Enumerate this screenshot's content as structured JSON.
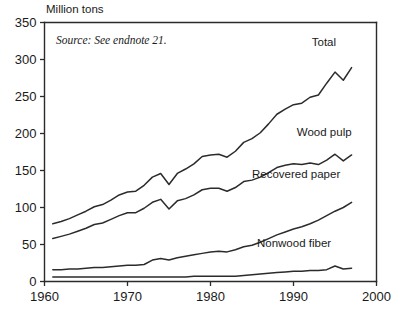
{
  "chart_data": {
    "type": "line",
    "title": "",
    "xlabel": "",
    "ylabel": "Million tons",
    "source_note": "Source: See endnote 21.",
    "grid": false,
    "legend_position": "inline-right",
    "xlim": [
      1960,
      2000
    ],
    "ylim": [
      0,
      350
    ],
    "xticks": [
      1960,
      1970,
      1980,
      1990,
      2000
    ],
    "yticks": [
      0,
      50,
      100,
      150,
      200,
      250,
      300,
      350
    ],
    "xtick_labels": [
      "1960",
      "1970",
      "1980",
      "1990",
      "2000"
    ],
    "ytick_labels": [
      "0",
      "50",
      "100",
      "150",
      "200",
      "250",
      "300",
      "350"
    ],
    "line_color": "#2b2b2b",
    "x": [
      1961,
      1962,
      1963,
      1964,
      1965,
      1966,
      1967,
      1968,
      1969,
      1970,
      1971,
      1972,
      1973,
      1974,
      1975,
      1976,
      1977,
      1978,
      1979,
      1980,
      1981,
      1982,
      1983,
      1984,
      1985,
      1986,
      1987,
      1988,
      1989,
      1990,
      1991,
      1992,
      1993,
      1994,
      1995,
      1996,
      1997
    ],
    "series": [
      {
        "name": "Total",
        "label": "Total",
        "values": [
          78,
          81,
          85,
          90,
          95,
          101,
          104,
          110,
          117,
          121,
          122,
          130,
          141,
          146,
          131,
          146,
          152,
          159,
          169,
          171,
          172,
          168,
          176,
          188,
          193,
          201,
          213,
          226,
          233,
          239,
          241,
          249,
          252,
          268,
          283,
          272,
          289
        ]
      },
      {
        "name": "Wood pulp",
        "label": "Wood pulp",
        "values": [
          58,
          61,
          64,
          68,
          72,
          77,
          79,
          84,
          89,
          93,
          93,
          99,
          107,
          111,
          98,
          109,
          112,
          117,
          124,
          126,
          126,
          122,
          127,
          135,
          137,
          141,
          147,
          154,
          157,
          159,
          158,
          160,
          158,
          164,
          172,
          163,
          171
        ]
      },
      {
        "name": "Recovered paper",
        "label": "Recovered paper",
        "values": [
          16,
          16,
          17,
          17,
          18,
          19,
          19,
          20,
          21,
          22,
          22,
          23,
          29,
          31,
          29,
          32,
          34,
          36,
          38,
          40,
          41,
          40,
          43,
          47,
          49,
          53,
          58,
          63,
          67,
          71,
          74,
          78,
          83,
          89,
          95,
          100,
          107
        ]
      },
      {
        "name": "Nonwood fiber",
        "label": "Nonwood fiber",
        "values": [
          6,
          6,
          6,
          6,
          6,
          6,
          6,
          6,
          6,
          6,
          6,
          6,
          6,
          6,
          6,
          6,
          6,
          7,
          7,
          7,
          7,
          7,
          7,
          8,
          9,
          10,
          11,
          12,
          13,
          14,
          14,
          15,
          15,
          16,
          21,
          17,
          18
        ]
      }
    ],
    "series_label_positions": [
      {
        "name": "Total",
        "x": 1992.2,
        "y": 318
      },
      {
        "name": "Wood pulp",
        "x": 1990.4,
        "y": 196
      },
      {
        "name": "Recovered paper",
        "x": 1985.0,
        "y": 140
      },
      {
        "name": "Nonwood fiber",
        "x": 1985.6,
        "y": 47
      }
    ]
  }
}
